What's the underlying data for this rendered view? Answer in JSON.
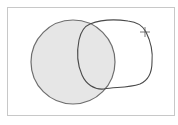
{
  "canvas": {
    "background": "#ffffff",
    "frame_border": "#c8c8c8"
  },
  "shapes": {
    "circle": {
      "name": "filled-circle",
      "fill": "#e6e6e6",
      "stroke": "#6e6e6e",
      "cx": 73,
      "cy": 62,
      "r": 42
    },
    "freeform": {
      "name": "hand-drawn-loop",
      "fill": "none",
      "stroke": "#4a4a4a"
    }
  },
  "cursor": {
    "type": "crosshair",
    "x": 145,
    "y": 32,
    "color": "#555555"
  }
}
